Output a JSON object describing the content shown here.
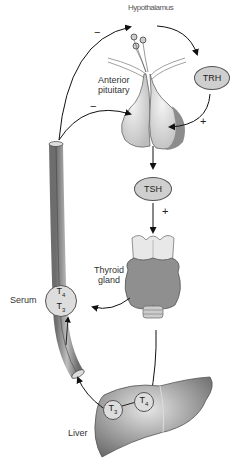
{
  "diagram": {
    "title_partial": "Hypothalamus",
    "labels": {
      "anterior_pituitary": [
        "Anterior",
        "pituitary"
      ],
      "thyroid_gland": [
        "Thyroid",
        "gland"
      ],
      "serum": "Serum",
      "liver": "Liver"
    },
    "hormones": {
      "trh": "TRH",
      "tsh": "TSH"
    },
    "serum_circle": {
      "top": "T",
      "top_sub": "4",
      "bottom": "T",
      "bottom_sub": "3"
    },
    "liver_circles": [
      {
        "label": "T",
        "sub": "3"
      },
      {
        "label": "T",
        "sub": "4"
      }
    ],
    "signs": {
      "hypothalamus_feedback": "−",
      "pituitary_feedback": "−",
      "trh_stimulation": "+",
      "tsh_stimulation": "+"
    },
    "colors": {
      "oval_fill": "#cfcfcf",
      "organ_gray": "#9a9a9a",
      "stroke": "#222222"
    }
  }
}
